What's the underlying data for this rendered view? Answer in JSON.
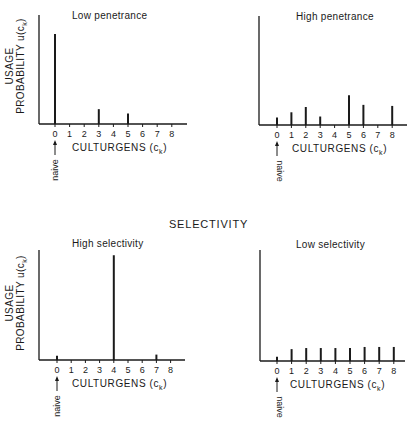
{
  "section_title": "SELECTIVITY",
  "common": {
    "ylabel_line1": "USAGE",
    "ylabel_line2": "PROBABILITY  u(c",
    "ylabel_sub": "k",
    "xlabel": "CULTURGENS  (c",
    "xlabel_sub": "k",
    "naive_label": "naive",
    "x_ticks": [
      "0",
      "1",
      "2",
      "3",
      "4",
      "5",
      "6",
      "7",
      "8"
    ]
  },
  "chart_data": [
    {
      "type": "bar",
      "title": "Low penetrance",
      "group": "penetrance",
      "xlabel": "CULTURGENS (c_k)",
      "ylabel": "USAGE PROBABILITY u(c_k)",
      "categories": [
        "0",
        "1",
        "2",
        "3",
        "4",
        "5",
        "6",
        "7",
        "8"
      ],
      "values": [
        0.85,
        0,
        0,
        0.14,
        0,
        0.1,
        0,
        0,
        0
      ],
      "annotation": "naive (arrow at 0)",
      "ylim": [
        0,
        1
      ]
    },
    {
      "type": "bar",
      "title": "High penetrance",
      "group": "penetrance",
      "xlabel": "CULTURGENS (c_k)",
      "ylabel": "",
      "categories": [
        "0",
        "1",
        "2",
        "3",
        "4",
        "5",
        "6",
        "7",
        "8"
      ],
      "values": [
        0.07,
        0.12,
        0.17,
        0.08,
        0,
        0.28,
        0.19,
        0,
        0.18
      ],
      "annotation": "naive (arrow at 0)",
      "ylim": [
        0,
        1
      ]
    },
    {
      "type": "bar",
      "title": "High selectivity",
      "group": "selectivity",
      "xlabel": "CULTURGENS (c_k)",
      "ylabel": "USAGE PROBABILITY u(c_k)",
      "categories": [
        "0",
        "1",
        "2",
        "3",
        "4",
        "5",
        "6",
        "7",
        "8"
      ],
      "values": [
        0.04,
        0,
        0,
        0,
        0.97,
        0,
        0,
        0.05,
        0
      ],
      "annotation": "naive (arrow at 0)",
      "ylim": [
        0,
        1
      ]
    },
    {
      "type": "bar",
      "title": "Low selectivity",
      "group": "selectivity",
      "xlabel": "CULTURGENS (c_k)",
      "ylabel": "",
      "categories": [
        "0",
        "1",
        "2",
        "3",
        "4",
        "5",
        "6",
        "7",
        "8"
      ],
      "values": [
        0.04,
        0.11,
        0.12,
        0.12,
        0.12,
        0.12,
        0.13,
        0.13,
        0.13
      ],
      "annotation": "naive (arrow at 0)",
      "ylim": [
        0,
        1
      ]
    }
  ]
}
